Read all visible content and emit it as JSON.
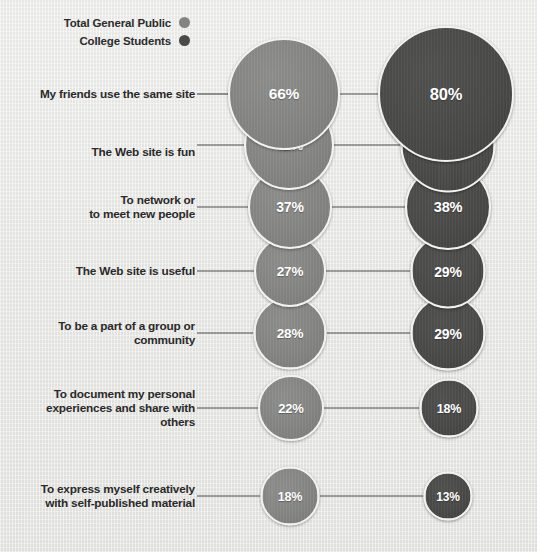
{
  "legend": {
    "items": [
      {
        "label": "Total General Public",
        "color": "#85857f",
        "icon": "legend-dot-icon"
      },
      {
        "label": "College Students",
        "color": "#4a4a48",
        "icon": "legend-dot-icon"
      }
    ]
  },
  "chart_data": {
    "type": "bar",
    "subtype": "bubble-comparison",
    "title": "",
    "xlabel": "",
    "ylabel": "",
    "legend_position": "top-left",
    "grid": false,
    "value_suffix": "%",
    "categories": [
      "My friends use the same site",
      "The Web site is fun",
      "To network or\nto meet new people",
      "The Web site is useful",
      "To be a part of a group or\ncommunity",
      "To document my personal\nexperiences and share with\nothers",
      "To express myself creatively\nwith self-published material"
    ],
    "series": [
      {
        "name": "Total General Public",
        "color": "#85857f",
        "values": [
          66,
          42,
          37,
          27,
          28,
          22,
          18
        ],
        "labels": [
          "66%",
          "42%",
          "37%",
          "27%",
          "28%",
          "22%",
          "18%"
        ]
      },
      {
        "name": "College Students",
        "color": "#4a4a48",
        "values": [
          80,
          44,
          38,
          29,
          29,
          18,
          13
        ],
        "labels": [
          "80%",
          "44%",
          "38%",
          "29%",
          "29%",
          "18%",
          "13%"
        ]
      }
    ]
  },
  "layout": {
    "rows": [
      {
        "cy": 94,
        "label_y": 94,
        "left": {
          "cx": 284,
          "d": 112,
          "fs": 15.5
        },
        "right": {
          "cx": 446,
          "d": 136,
          "fs": 16.5
        }
      },
      {
        "cy": 145,
        "label_y": 152,
        "left": {
          "cx": 289,
          "d": 90,
          "fs": 14.5
        },
        "right": {
          "cx": 448,
          "d": 95,
          "fs": 15
        }
      },
      {
        "cy": 207,
        "label_y": 207,
        "left": {
          "cx": 290,
          "d": 84,
          "fs": 14
        },
        "right": {
          "cx": 448,
          "d": 86,
          "fs": 14.5
        }
      },
      {
        "cy": 271,
        "label_y": 271,
        "left": {
          "cx": 290,
          "d": 72,
          "fs": 13.5
        },
        "right": {
          "cx": 448,
          "d": 75,
          "fs": 14
        }
      },
      {
        "cy": 333,
        "label_y": 333,
        "left": {
          "cx": 290,
          "d": 73,
          "fs": 13.5
        },
        "right": {
          "cx": 448,
          "d": 75,
          "fs": 14
        }
      },
      {
        "cy": 408,
        "label_y": 408,
        "left": {
          "cx": 291,
          "d": 66,
          "fs": 13
        },
        "right": {
          "cx": 449,
          "d": 59,
          "fs": 12.5
        }
      },
      {
        "cy": 496,
        "label_y": 496,
        "left": {
          "cx": 290,
          "d": 59,
          "fs": 12.5
        },
        "right": {
          "cx": 448,
          "d": 49,
          "fs": 12
        }
      }
    ],
    "label_right_edge": 195,
    "line_color": "#4d4d4d"
  }
}
